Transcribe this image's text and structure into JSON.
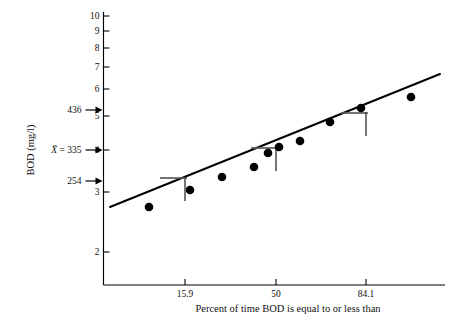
{
  "chart_data": {
    "type": "scatter",
    "title": "",
    "xlabel": "Percent of time BOD is equal to or less than",
    "ylabel": "BOD (mg/l)",
    "x_scale": "probability",
    "y_scale": "log",
    "grid": false,
    "legend": "none",
    "xlim": [
      5,
      95
    ],
    "ylim": [
      1.85,
      10
    ],
    "x_ticks": [
      {
        "value": 15.9,
        "label": "15.9",
        "px": 185
      },
      {
        "value": 50,
        "label": "50",
        "px": 276
      },
      {
        "value": 84.1,
        "label": "84.1",
        "px": 366
      }
    ],
    "y_ticks": [
      {
        "value": 10,
        "label": "10",
        "px": 16
      },
      {
        "value": 9,
        "label": "9",
        "px": 31
      },
      {
        "value": 8,
        "label": "8",
        "px": 48
      },
      {
        "value": 7,
        "label": "7",
        "px": 67
      },
      {
        "value": 6,
        "label": "6",
        "px": 89
      },
      {
        "value": 5,
        "label": "5",
        "px": 116
      },
      {
        "value": 4,
        "label": "4",
        "px": 150
      },
      {
        "value": 3,
        "label": "3",
        "px": 192
      },
      {
        "value": 2,
        "label": "2",
        "px": 252
      }
    ],
    "annotations": [
      {
        "label": "436",
        "y_value": 4.36,
        "px": 110,
        "arrow": true
      },
      {
        "label": "X̄ = 335",
        "y_value": 3.35,
        "px": 150,
        "arrow": true,
        "italic_x": true
      },
      {
        "label": "254",
        "y_value": 2.54,
        "px": 181,
        "arrow": true
      }
    ],
    "points": [
      {
        "x": 10.5,
        "y": 2.05,
        "px": 149,
        "py": 207
      },
      {
        "x": 15.9,
        "y": 2.27,
        "px": 190,
        "py": 190
      },
      {
        "x": 23.0,
        "y": 2.52,
        "px": 222,
        "py": 177
      },
      {
        "x": 32.0,
        "y": 2.8,
        "px": 254,
        "py": 167
      },
      {
        "x": 42.0,
        "y": 3.07,
        "px": 268,
        "py": 153
      },
      {
        "x": 50.0,
        "y": 3.36,
        "px": 279,
        "py": 147
      },
      {
        "x": 57.0,
        "y": 3.55,
        "px": 300,
        "py": 141
      },
      {
        "x": 70.0,
        "y": 4.13,
        "px": 330,
        "py": 122
      },
      {
        "x": 84.1,
        "y": 4.55,
        "px": 361,
        "py": 108
      },
      {
        "x": 92.0,
        "y": 4.95,
        "px": 411,
        "py": 97
      }
    ],
    "markers": [
      {
        "name": "minus-one-sigma",
        "x": 15.9,
        "y": 2.54,
        "px": 185,
        "py": 178
      },
      {
        "name": "median-mean",
        "x": 50,
        "y": 3.35,
        "px": 276,
        "py": 148
      },
      {
        "name": "plus-one-sigma",
        "x": 84.1,
        "y": 4.36,
        "px": 366,
        "py": 113
      }
    ],
    "fit_line": {
      "x_start_px": 110,
      "y_start_px": 207,
      "x_end_px": 440,
      "y_end_px": 74,
      "description": "least-squares straight line on log-probability scale"
    },
    "series_name": "BOD observations",
    "values": [
      2.05,
      2.27,
      2.52,
      2.8,
      3.07,
      3.36,
      3.55,
      4.13,
      4.55,
      4.95
    ],
    "x": [
      10.5,
      15.9,
      23.0,
      32.0,
      42.0,
      50.0,
      57.0,
      70.0,
      84.1,
      92.0
    ],
    "categories": [
      "10.5",
      "15.9",
      "23.0",
      "32.0",
      "42.0",
      "50.0",
      "57.0",
      "70.0",
      "84.1",
      "92.0"
    ]
  },
  "colors": {
    "ink": "#000000",
    "marker_gray": "#5a5a5a",
    "background": "#ffffff"
  }
}
